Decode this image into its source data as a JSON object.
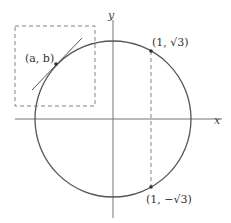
{
  "diagram": {
    "axes": {
      "x_label": "x",
      "y_label": "y"
    },
    "points": [
      {
        "name": "point-a-b",
        "label": "(a, b)"
      },
      {
        "name": "point-1-sqrt3",
        "label": "(1, √3)"
      },
      {
        "name": "point-1-neg-sqrt3",
        "label": "(1, −√3)"
      }
    ],
    "colors": {
      "curve": "#555555",
      "axis": "#666666",
      "dashed": "#777777",
      "text": "#333333"
    }
  }
}
